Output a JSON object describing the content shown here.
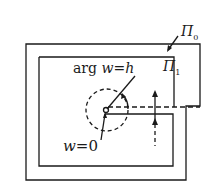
{
  "diagram": {
    "labels": {
      "pi0": "Π",
      "pi0_sub": "0",
      "pi1": "Π",
      "pi1_sub": "1",
      "arg_text": "arg",
      "arg_var": "w",
      "arg_eq": "=",
      "arg_val": "h",
      "w0_var": "w",
      "w0_eq": "=",
      "w0_val": "0"
    },
    "colors": {
      "stroke": "#1a1a1a",
      "background": "#ffffff"
    }
  }
}
